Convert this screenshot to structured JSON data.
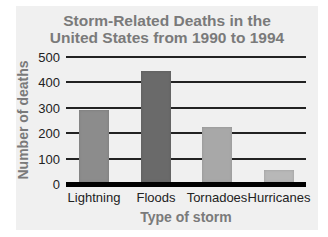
{
  "chart_data": {
    "type": "bar",
    "title": "Storm-Related Deaths in the United States from 1990 to 1994",
    "title_lines": [
      "Storm-Related Deaths in the",
      "United States from 1990 to 1994"
    ],
    "xlabel": "Type of storm",
    "ylabel": "Number of deaths",
    "categories": [
      "Lightning",
      "Floods",
      "Tornadoes",
      "Hurricanes"
    ],
    "values": [
      290,
      445,
      225,
      55
    ],
    "yticks": [
      0,
      100,
      200,
      300,
      400,
      500
    ],
    "ylim": [
      0,
      500
    ],
    "grid": true,
    "legend": null,
    "colors": [
      "#8c8c8c",
      "#6a6a6a",
      "#a8a8a8",
      "#b8b8b8"
    ]
  }
}
